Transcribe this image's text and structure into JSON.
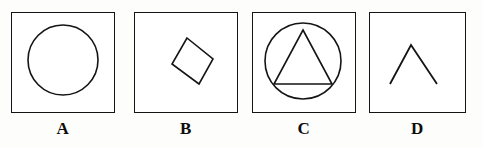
{
  "figure": {
    "type": "geometric-shape-options",
    "background_color": "#fdfdfb",
    "stroke_color": "#141414",
    "panel_count": 4,
    "panels": [
      {
        "label": "A",
        "shape_name": "circle",
        "box": {
          "x": 11,
          "y": 12,
          "width": 104,
          "height": 101
        },
        "shape": {
          "type": "circle",
          "cx": 52,
          "cy": 48,
          "r": 35
        }
      },
      {
        "label": "B",
        "shape_name": "rhombus",
        "box": {
          "x": 134,
          "y": 12,
          "width": 104,
          "height": 101
        },
        "shape": {
          "type": "polygon",
          "points": "44,5 70,26 56,51 29,31"
        }
      },
      {
        "label": "C",
        "shape_name": "circle-with-inscribed-triangle",
        "box": {
          "x": 252,
          "y": 12,
          "width": 104,
          "height": 101
        },
        "shape": {
          "type": "circle-and-triangle",
          "circle": {
            "cx": 51,
            "cy": 49,
            "r": 38
          },
          "triangle": "51,18 80,72 22,72"
        }
      },
      {
        "label": "D",
        "shape_name": "open-chevron",
        "box": {
          "x": 369,
          "y": 12,
          "width": 97,
          "height": 101
        },
        "shape": {
          "type": "polyline",
          "points": "21,72 42,33 68,72"
        }
      }
    ]
  }
}
